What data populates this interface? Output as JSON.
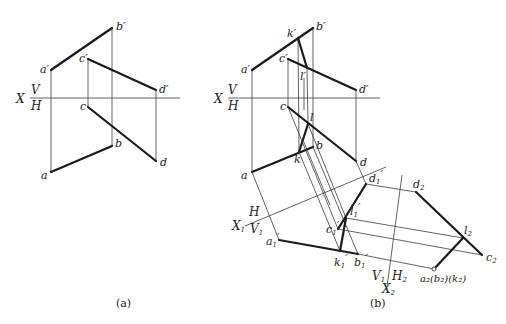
{
  "figure_a": {
    "caption": "(a)",
    "axis": {
      "x": "X",
      "upper": "V",
      "lower": "H"
    },
    "labels": {
      "a_prime": "a′",
      "b_prime": "b′",
      "c_prime": "c′",
      "d_prime": "d′",
      "a": "a",
      "b": "b",
      "c": "c",
      "d": "d"
    }
  },
  "figure_b": {
    "caption": "(b)",
    "axis": {
      "x": "X",
      "upper": "V",
      "lower": "H"
    },
    "axis1": {
      "x": "X",
      "x_sub": "1",
      "upper": "H",
      "lower": "V",
      "lower_sub": "1"
    },
    "axis2": {
      "x": "X",
      "x_sub": "2",
      "left": "V",
      "left_sub": "1",
      "right": "H",
      "right_sub": "2"
    },
    "labels": {
      "a_prime": "a′",
      "b_prime": "b′",
      "c_prime": "c′",
      "d_prime": "d′",
      "k_prime": "k′",
      "l_prime": "l′",
      "a": "a",
      "b": "b",
      "c": "c",
      "d": "d",
      "k": "k",
      "l": "l",
      "a1": "a",
      "b1": "b",
      "c1": "c",
      "d1": "d",
      "k1": "k",
      "l1": "l",
      "aux1_sub": "1",
      "d2": "d",
      "l2": "l",
      "c2": "c",
      "aux2_sub": "2",
      "a2_group": "a₂(b₂)(k₂)"
    }
  }
}
